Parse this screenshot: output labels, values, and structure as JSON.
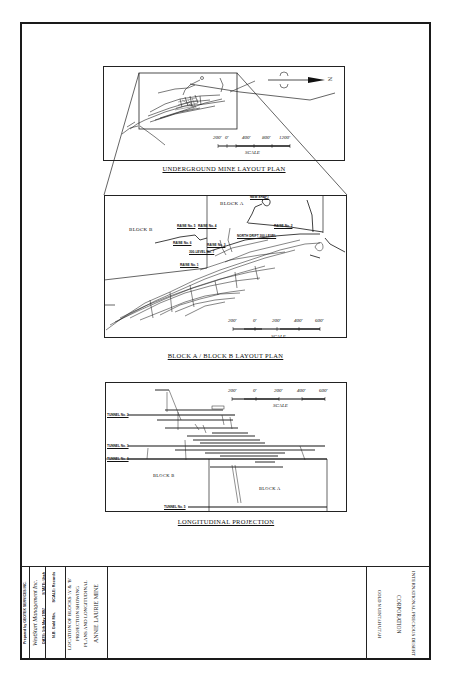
{
  "drawing": {
    "type": "engineering-sheet",
    "orientation": "portrait-with-rotated-title-block"
  },
  "panels": {
    "underground_plan": {
      "caption": "UNDERGROUND MINE LAYOUT PLAN",
      "north_label": "N",
      "scale": {
        "ticks": [
          "200'",
          "0'",
          "400'",
          "800'",
          "1200'"
        ],
        "label": "SCALE"
      }
    },
    "block_plan": {
      "caption": "BLOCK A / BLOCK B LAYOUT PLAN",
      "block_a_label": "BLOCK A",
      "block_b_label": "BLOCK B",
      "annotations": [
        "RAISE No. 5",
        "RAISE No. 4",
        "RAISE No. 6",
        "RAISE No. 3",
        "300-LEVEL No. 7",
        "RAISE No. 1",
        "NORTH DRIFT 300-LEVEL",
        "RAISE No. 2",
        "NEW SHAFT"
      ],
      "scale": {
        "ticks": [
          "200'",
          "0'",
          "200'",
          "400'",
          "600'"
        ],
        "label": "SCALE"
      }
    },
    "longitudinal": {
      "caption": "LONGITUDINAL PROJECTION",
      "block_a_label": "BLOCK A",
      "block_b_label": "BLOCK B",
      "levels": [
        "TUNNEL No. 2",
        "TUNNEL No. 3",
        "TUNNEL No. 4",
        "TUNNEL No. 5"
      ],
      "scale": {
        "ticks": [
          "200'",
          "0'",
          "200'",
          "400'",
          "600'"
        ],
        "label": "SCALE"
      }
    }
  },
  "title_block": {
    "client_line1": "INTERNATIONAL PRECIOUS DESERT",
    "client_line2": "CORPORATION",
    "client_location": "GOLD N UINTAH UTAH",
    "title_line1": "ANNIE LAURIE MINE",
    "title_line2": "PLANS AND LONGITUDINAL",
    "title_line3": "PROJECTION SHOWING",
    "title_line4": "LOCATION OF BLOCKS 'A' & 'B'",
    "scale_label": "SCALE: Records",
    "drawn_label": "N.B. Gold Min.",
    "state_label": "STATE: Utah",
    "date_label": "DATE: 5th May 1997",
    "company": "WestStart Management Inc.",
    "prepared_by": "Prepared by GEOTEK SERVICES INC."
  }
}
